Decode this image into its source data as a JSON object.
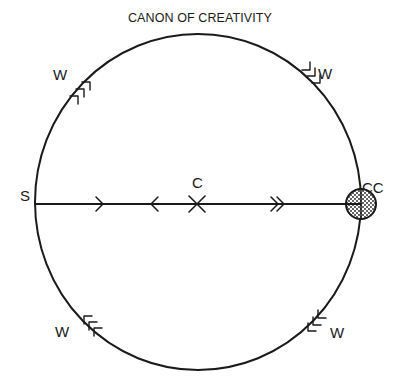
{
  "diagram": {
    "title": "CANON OF CREATIVITY",
    "colors": {
      "ink": "#1a1a1a",
      "background": "#ffffff"
    },
    "circle": {
      "cx": 198,
      "cy": 202,
      "rx": 163,
      "ry": 168
    },
    "axis": {
      "from_label": "S",
      "center_label": "C",
      "to_label": "CC",
      "y": 204
    },
    "points": {
      "S": {
        "label": "S",
        "x": 26,
        "y": 200
      },
      "C": {
        "label": "C",
        "x": 197,
        "y": 186
      },
      "CC": {
        "label": "CC",
        "x": 362,
        "y": 193
      }
    },
    "axis_markers": [
      {
        "type": "single-arrow-right",
        "x": 102
      },
      {
        "type": "single-arrow-left",
        "x": 152
      },
      {
        "type": "cross",
        "x": 197
      },
      {
        "type": "double-arrow-right",
        "x": 277
      }
    ],
    "wall_markers": [
      {
        "label": "W",
        "position": "top-left",
        "label_x": 62,
        "label_y": 78
      },
      {
        "label": "W",
        "position": "top-right",
        "label_x": 325,
        "label_y": 77
      },
      {
        "label": "W",
        "position": "bottom-left",
        "label_x": 61,
        "label_y": 337
      },
      {
        "label": "W",
        "position": "bottom-right",
        "label_x": 334,
        "label_y": 336
      }
    ],
    "endpoint": {
      "label": "CC",
      "shape": "stippled-circle",
      "cx": 361,
      "cy": 204,
      "r": 15
    }
  }
}
